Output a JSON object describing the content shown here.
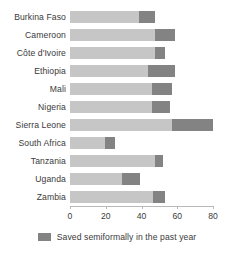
{
  "chart_data": {
    "type": "bar",
    "orientation": "horizontal",
    "stacked": true,
    "title": "",
    "subtitle": "",
    "xlabel": "",
    "ylabel": "",
    "xlim": [
      0,
      80
    ],
    "xticks": [
      0,
      20,
      40,
      60,
      80
    ],
    "xtick_labels": [
      "0",
      "20",
      "40",
      "60",
      "80"
    ],
    "grid": false,
    "legend_position": "bottom-center",
    "categories": [
      "Burkina Faso",
      "Cameroon",
      "Côte d'Ivoire",
      "Ethiopia",
      "Mali",
      "Nigeria",
      "Sierra Leone",
      "South Africa",
      "Tanzania",
      "Uganda",
      "Zambia"
    ],
    "series": [
      {
        "name": "Saved (other)",
        "color": "#c6c6c6",
        "values": [
          38.5,
          47.5,
          47.5,
          43.5,
          46,
          46,
          57,
          19.5,
          47.5,
          29,
          46.5
        ]
      },
      {
        "name": "Saved semiformally in the past year",
        "color": "#838383",
        "values": [
          9,
          11,
          5.5,
          15,
          11,
          10,
          23,
          5.5,
          4.5,
          10,
          6.5
        ]
      }
    ],
    "totals": [
      47.5,
      58.5,
      53,
      58.5,
      57,
      56,
      80,
      25,
      52,
      39,
      53
    ]
  },
  "legend": {
    "items": [
      {
        "label": "Saved semiformally in the past year",
        "color": "#838383"
      }
    ]
  },
  "colors": {
    "segment_light": "#c6c6c6",
    "segment_dark": "#838383",
    "axis": "#b8b8b8",
    "text": "#3a3a3a",
    "background": "#ffffff"
  }
}
